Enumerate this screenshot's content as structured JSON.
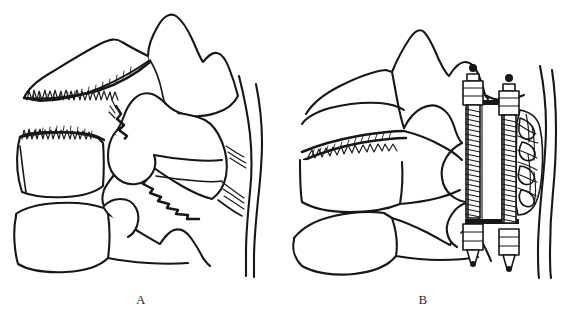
{
  "figure": {
    "background_color": "#ffffff",
    "ink_color": "#171717",
    "width": 564,
    "height": 325,
    "panels": [
      {
        "id": "A",
        "caption": "A",
        "description": "Lateral line drawing of three cervical vertebrae showing a comminuted fracture of the middle vertebral body with jagged fracture lines through the superior endplate and a diagonal zigzag fracture line extending posteriorly toward the spinal canal.",
        "features": [
          "superior vertebra",
          "fractured middle vertebral body",
          "inferior vertebra",
          "jagged endplate fracture serrations",
          "diagonal zigzag fracture line",
          "posterior spinal canal lines",
          "retropulsed fragment"
        ]
      },
      {
        "id": "B",
        "caption": "B",
        "description": "Lateral line drawing of the same cervical segment after surgical reduction and anterior instrumentation: two threaded screws with hexagonal heads and conical tips span the levels, connected by an anterior plate, with cancellous bone graft packed posteriorly.",
        "features": [
          "superior vertebra",
          "reduced vertebral body",
          "inferior vertebra",
          "reduced zigzag fracture seam",
          "anterior threaded screw (anterior)",
          "anterior threaded screw (posterior)",
          "anterior plate / cage",
          "cancellous bone graft",
          "posterior spinal canal lines"
        ]
      }
    ]
  }
}
